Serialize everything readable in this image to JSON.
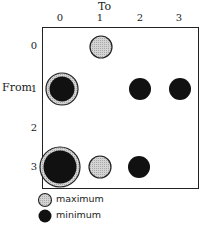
{
  "axes": {
    "x_title": "To",
    "y_title": "From",
    "x_ticks": [
      "0",
      "1",
      "2",
      "3"
    ],
    "y_ticks": [
      "0",
      "1",
      "2",
      "3"
    ]
  },
  "cells": [
    {
      "from": 0,
      "to": 1,
      "type": "maximum"
    },
    {
      "from": 1,
      "to": 0,
      "type": "both"
    },
    {
      "from": 1,
      "to": 2,
      "type": "minimum"
    },
    {
      "from": 1,
      "to": 3,
      "type": "minimum"
    },
    {
      "from": 3,
      "to": 0,
      "type": "both-large"
    },
    {
      "from": 3,
      "to": 1,
      "type": "maximum"
    },
    {
      "from": 3,
      "to": 2,
      "type": "minimum"
    }
  ],
  "legend": {
    "items": [
      {
        "label": "maximum",
        "color": "#c8c8c8"
      },
      {
        "label": "minimum",
        "color": "#111111"
      }
    ]
  },
  "colors": {
    "maximum_fill": "#c8c8c8",
    "minimum_fill": "#111111",
    "stroke": "#222222"
  }
}
